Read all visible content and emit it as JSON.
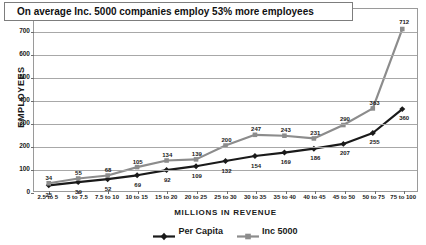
{
  "chart_data": {
    "type": "line",
    "title": "On average Inc. 5000 companies employ 53% more employees",
    "xlabel": "MILLIONS IN REVENUE",
    "ylabel": "EMPLOYEES",
    "ylim": [
      0,
      800
    ],
    "ytick_step": 100,
    "yticks": [
      "0",
      "100",
      "200",
      "300",
      "400",
      "500",
      "600",
      "700",
      "800"
    ],
    "grid": true,
    "legend_position": "bottom",
    "categories": [
      "2.5 to 5",
      "5 to 7.5",
      "7.5 to 10",
      "10 to 15",
      "15 to 20",
      "20 to 25",
      "25 to 30",
      "30 to 35",
      "35 to 40",
      "40 to 45",
      "45 to 50",
      "50 to 75",
      "75 to 100"
    ],
    "series": [
      {
        "name": "Per Capita",
        "color": "#1a1a1a",
        "marker": "diamond",
        "values": [
          25,
          39,
          52,
          69,
          92,
          109,
          132,
          154,
          169,
          186,
          207,
          255,
          360
        ]
      },
      {
        "name": "Inc 5000",
        "color": "#8c8c8c",
        "marker": "square",
        "values": [
          34,
          55,
          68,
          105,
          134,
          139,
          200,
          247,
          243,
          231,
          290,
          363,
          712
        ]
      }
    ]
  },
  "colors": {
    "per_capita": "#1a1a1a",
    "inc_5000": "#8c8c8c",
    "gridline": "#a8a8a8",
    "frame": "#9a9a9a",
    "text": "#1a1a1a"
  }
}
